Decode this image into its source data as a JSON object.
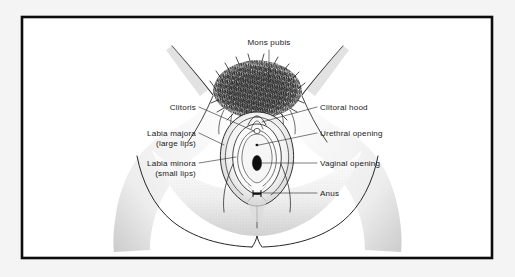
{
  "figure": {
    "kind": "anatomical-illustration",
    "style": "pen-and-ink line drawing with stippled shading",
    "background_color": "#f4f4f4",
    "panel_color": "#ffffff",
    "frame_color": "#0c0c0c",
    "ink_color": "#262626"
  },
  "labels": {
    "mons_pubis": "Mons pubis",
    "clitoris": "Clitoris",
    "clitoral_hood": "Clitoral hood",
    "labia_majora_line1": "Labia majora",
    "labia_majora_line2": "(large lips)",
    "labia_minora_line1": "Labia minora",
    "labia_minora_line2": "(small lips)",
    "urethral_opening": "Urethral opening",
    "vaginal_opening": "Vaginal opening",
    "anus": "Anus"
  },
  "annotations": [
    {
      "id": "mons-pubis",
      "text": "Mons pubis",
      "side": "top",
      "x": 269,
      "y": 45
    },
    {
      "id": "clitoris",
      "text": "Clitoris",
      "side": "left",
      "x": 196,
      "y": 110
    },
    {
      "id": "clitoral-hood",
      "text": "Clitoral hood",
      "side": "right",
      "x": 320,
      "y": 110
    },
    {
      "id": "labia-majora",
      "text": "Labia majora",
      "side": "left",
      "x": 196,
      "y": 136
    },
    {
      "id": "urethral-opening",
      "text": "Urethral opening",
      "side": "right",
      "x": 320,
      "y": 136
    },
    {
      "id": "labia-minora",
      "text": "Labia minora",
      "side": "left",
      "x": 196,
      "y": 166
    },
    {
      "id": "vaginal-opening",
      "text": "Vaginal opening",
      "side": "right",
      "x": 320,
      "y": 166
    },
    {
      "id": "anus",
      "text": "Anus",
      "side": "right",
      "x": 320,
      "y": 194
    }
  ]
}
